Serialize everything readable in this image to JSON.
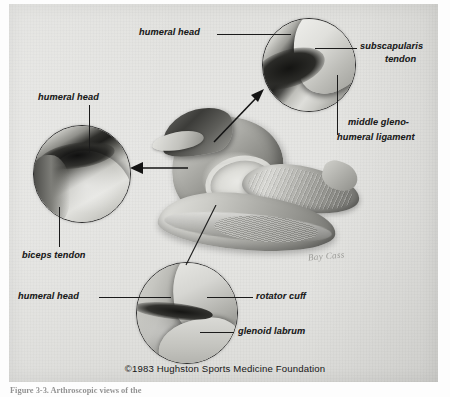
{
  "figure": {
    "copyright": "©1983 Hughston Sports Medicine Foundation",
    "signature": "Bay Cass",
    "caption_fragment": "Figure 3-3. Arthroscopic views of the"
  },
  "labels": {
    "humeral_head_top": "humeral  head",
    "subscapularis_tendon_line1": "subscapularis",
    "subscapularis_tendon_line2": "tendon",
    "middle_glenohumeral_line1": "middle  gleno-",
    "middle_glenohumeral_line2": "humeral  ligament",
    "humeral_head_left": "humeral  head",
    "biceps_tendon": "biceps  tendon",
    "humeral_head_bottom": "humeral  head",
    "rotator_cuff": "rotator  cuff",
    "glenoid_labrum": "glenoid  labrum"
  },
  "insets": [
    {
      "id": "scope-top",
      "position": "top-right",
      "labels": [
        "humeral  head",
        "subscapularis  tendon",
        "middle  gleno-humeral  ligament"
      ]
    },
    {
      "id": "scope-left",
      "position": "left",
      "labels": [
        "humeral  head",
        "biceps  tendon"
      ]
    },
    {
      "id": "scope-bot",
      "position": "bottom",
      "labels": [
        "humeral  head",
        "rotator  cuff",
        "glenoid  labrum"
      ]
    }
  ],
  "colors": {
    "plate_background": "#e2e2df",
    "ink": "#1b1b1b",
    "page_background": "#fdfdfd",
    "signature": "#8a8a86"
  }
}
